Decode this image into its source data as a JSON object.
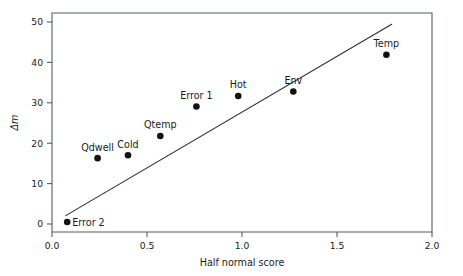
{
  "chart_data": {
    "type": "scatter",
    "title": "",
    "xlabel": "Half normal score",
    "ylabel": "Δm",
    "xlim": [
      0.0,
      2.0
    ],
    "ylim": [
      0,
      52
    ],
    "grid": false,
    "legend": "none",
    "xticks": [
      "0.0",
      "0.5",
      "1.0",
      "1.5",
      "2.0"
    ],
    "xtick_values": [
      0.0,
      0.5,
      1.0,
      1.5,
      2.0
    ],
    "yticks": [
      "0",
      "10",
      "20",
      "30",
      "40",
      "50"
    ],
    "ytick_values": [
      0,
      10,
      20,
      30,
      40,
      50
    ],
    "points": [
      {
        "label": "Error 2",
        "x": 0.08,
        "y": 0.5,
        "label_pos": "right"
      },
      {
        "label": "Qdwell",
        "x": 0.24,
        "y": 16.3,
        "label_pos": "above"
      },
      {
        "label": "Cold",
        "x": 0.4,
        "y": 17.0,
        "label_pos": "above"
      },
      {
        "label": "Qtemp",
        "x": 0.57,
        "y": 21.8,
        "label_pos": "above"
      },
      {
        "label": "Error 1",
        "x": 0.76,
        "y": 29.1,
        "label_pos": "above"
      },
      {
        "label": "Hot",
        "x": 0.98,
        "y": 31.7,
        "label_pos": "above"
      },
      {
        "label": "Env",
        "x": 1.27,
        "y": 32.8,
        "label_pos": "above"
      },
      {
        "label": "Temp",
        "x": 1.76,
        "y": 41.9,
        "label_pos": "above"
      }
    ],
    "series": [
      {
        "name": "Half normal plot points",
        "x": [
          0.08,
          0.24,
          0.4,
          0.57,
          0.76,
          0.98,
          1.27,
          1.76
        ],
        "values": [
          0.5,
          16.3,
          17.0,
          21.8,
          29.1,
          31.7,
          32.8,
          41.9
        ]
      }
    ],
    "reference_line": {
      "name": "fitted line",
      "x0": 0.07,
      "y0": 2.0,
      "x1": 1.79,
      "y1": 49.5
    },
    "colors": {
      "point": "#121212",
      "line": "#2b2b2b",
      "axis": "#555d60",
      "text": "#1a1a1a",
      "background": "#ffffff"
    }
  }
}
